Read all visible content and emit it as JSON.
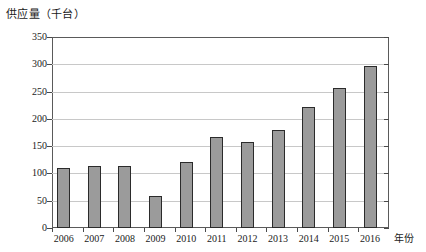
{
  "chart_data": {
    "type": "bar",
    "title": "",
    "ylabel": "供应量（千台）",
    "xlabel": "年份",
    "categories": [
      "2006",
      "2007",
      "2008",
      "2009",
      "2010",
      "2011",
      "2012",
      "2013",
      "2014",
      "2015",
      "2016"
    ],
    "values": [
      110,
      114,
      114,
      59,
      121,
      167,
      158,
      180,
      222,
      256,
      296
    ],
    "ylim": [
      0,
      350
    ],
    "yticks": [
      0,
      50,
      100,
      150,
      200,
      250,
      300,
      350
    ],
    "ytick_labels": [
      "0",
      "50",
      "100",
      "150",
      "200",
      "250",
      "300",
      "350"
    ],
    "grid": true,
    "legend": "none",
    "series_name": "供应量",
    "bar_color": "#9b9b9b",
    "bar_border_color": "#2b2b2b",
    "grid_color": "#c8c8c8",
    "axis_color": "#5a5a5a"
  }
}
